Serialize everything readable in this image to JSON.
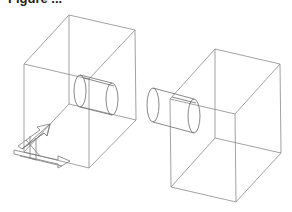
{
  "figure": {
    "caption_fragment": "Figure ...",
    "stroke_color": "#8a8a8a",
    "background": "#ffffff"
  },
  "left_box": {
    "name": "left-block",
    "vertices": {
      "back_top_left": [
        69,
        15
      ],
      "back_top_right": [
        135,
        30
      ],
      "front_top_left": [
        24,
        64
      ],
      "front_top_right": [
        89,
        79
      ],
      "front_bottom_left": [
        24,
        152
      ],
      "front_bottom_right": [
        89,
        168
      ],
      "back_bottom_right": [
        136,
        120
      ],
      "back_bottom_left": [
        69,
        104
      ]
    },
    "cylinder": {
      "ellipse_a": [
        80,
        91,
        6,
        16
      ],
      "ellipse_b": [
        112,
        98,
        6,
        16
      ]
    }
  },
  "right_box": {
    "name": "right-block",
    "vertices": {
      "back_top_left": [
        215,
        49
      ],
      "back_top_right": [
        280,
        64
      ],
      "front_top_left": [
        170,
        99
      ],
      "front_top_right": [
        235,
        114
      ],
      "front_bottom_left": [
        171,
        187
      ],
      "front_bottom_right": [
        236,
        202
      ],
      "back_bottom_right": [
        281,
        153
      ],
      "back_bottom_left": [
        215,
        138
      ]
    },
    "cylinder": {
      "ellipse_a": [
        152,
        105,
        6,
        17
      ],
      "ellipse_b": [
        195,
        116,
        6,
        17
      ]
    }
  },
  "axis_triad": {
    "name": "coordinate-axes",
    "origin": [
      22,
      148
    ]
  }
}
